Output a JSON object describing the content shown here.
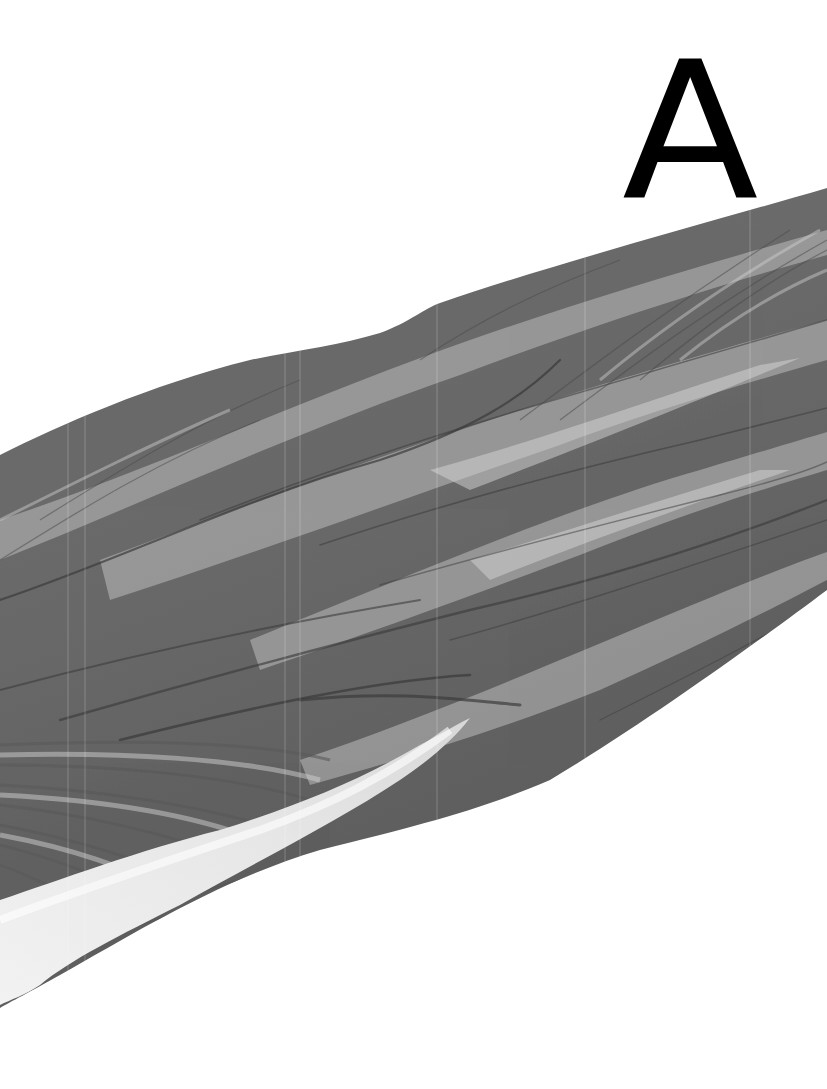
{
  "figure": {
    "panel_label": "A",
    "style": "grayscale",
    "colors": {
      "background": "#ffffff",
      "muscle_base": "#6e6e6e",
      "muscle_highlight": "#c8c8c8",
      "muscle_shadow": "#3a3a3a",
      "tendon": "#ececec",
      "label": "#000000"
    }
  }
}
